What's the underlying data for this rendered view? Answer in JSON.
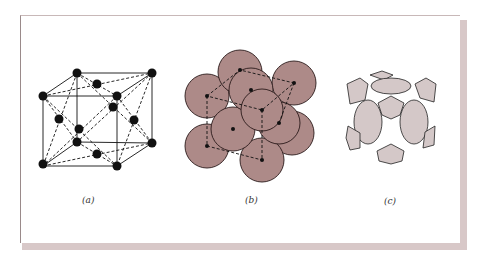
{
  "figure": {
    "panels": [
      {
        "id": "a",
        "label": "(a)",
        "description": "face-centered cubic lattice: ball-and-stick with dashed face diagonals"
      },
      {
        "id": "b",
        "label": "(b)",
        "description": "hard-sphere packing model of FCC unit cell"
      },
      {
        "id": "c",
        "label": "(c)",
        "description": "reduced-sphere unit cell showing sphere sections inside cube"
      }
    ],
    "colors": {
      "frame_shadow": "#d8c8c8",
      "sphere_fill_b": "#ad8a88",
      "sphere_fill_c": "#d4c8c8",
      "line": "#111111"
    }
  }
}
